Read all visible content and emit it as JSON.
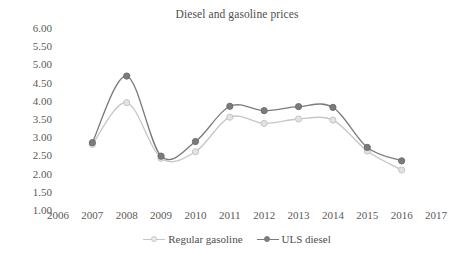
{
  "chart_data": {
    "type": "line",
    "title": "Diesel and gasoline prices",
    "xlabel": "",
    "ylabel": "",
    "x": [
      2007,
      2008,
      2009,
      2010,
      2011,
      2012,
      2013,
      2014,
      2015,
      2016
    ],
    "categories": [
      "2007",
      "2008",
      "2009",
      "2010",
      "2011",
      "2012",
      "2013",
      "2014",
      "2015",
      "2016"
    ],
    "series": [
      {
        "name": "Regular gasoline",
        "color": "#c6c6c6",
        "marker": "circle-open",
        "values": [
          2.8,
          3.95,
          2.42,
          2.6,
          3.55,
          3.38,
          3.5,
          3.47,
          2.62,
          2.1
        ]
      },
      {
        "name": "ULS diesel",
        "color": "#7b7b7b",
        "marker": "circle-filled",
        "values": [
          2.85,
          4.68,
          2.48,
          2.88,
          3.85,
          3.73,
          3.84,
          3.82,
          2.72,
          2.35
        ]
      }
    ],
    "xlim": [
      2006,
      2017
    ],
    "ylim": [
      1.0,
      6.0
    ],
    "x_tick_labels": [
      "2006",
      "2007",
      "2008",
      "2009",
      "2010",
      "2011",
      "2012",
      "2013",
      "2014",
      "2015",
      "2016",
      "2017"
    ],
    "y_tick_labels": [
      "6.00",
      "5.50",
      "5.00",
      "4.50",
      "4.00",
      "3.50",
      "3.00",
      "2.50",
      "2.00",
      "1.50",
      "1.00"
    ],
    "y_tick_values": [
      6.0,
      5.5,
      5.0,
      4.5,
      4.0,
      3.5,
      3.0,
      2.5,
      2.0,
      1.5,
      1.0
    ],
    "grid": false,
    "legend_position": "bottom",
    "smoothing": "spline"
  },
  "legend": {
    "items": [
      {
        "label": "Regular gasoline",
        "color": "#c6c6c6"
      },
      {
        "label": "ULS diesel",
        "color": "#7b7b7b"
      }
    ]
  }
}
